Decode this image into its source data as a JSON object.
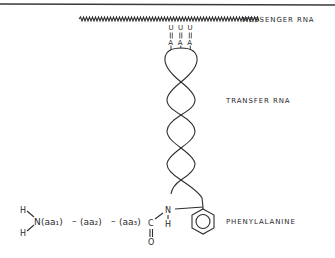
{
  "figure": {
    "labels": {
      "messenger_rna": "MESSENGER RNA",
      "transfer_rna": "TRANSFER RNA",
      "amino_acid": "PHENYLALANINE"
    },
    "codon": [
      "U",
      "U",
      "U"
    ],
    "anticodon": [
      "A",
      "A",
      "A"
    ],
    "pairing_symbol": "||",
    "peptide": {
      "amino_terminus_h_top": "H",
      "amino_terminus_h_bottom": "H",
      "nitrogen": "N",
      "residue_1": "(aa₁)",
      "residue_2": "(aa₂)",
      "residue_3": "(aa₃)",
      "dash": "–",
      "carbonyl_carbon": "C",
      "carbonyl_oxygen": "O",
      "amide_nitrogen": "N",
      "amide_hydrogen": "H"
    },
    "colors": {
      "ink": "#2e2e2e",
      "background": "#ffffff",
      "border": "#3a3a3a"
    }
  }
}
